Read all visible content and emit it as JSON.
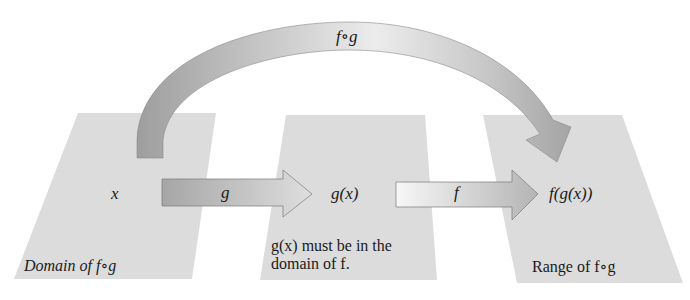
{
  "diagram": {
    "colors": {
      "panel": "#dcdcdc",
      "arrow_dark": "#a9a9a9",
      "arrow_light": "#f2f2f2",
      "text": "#1a1a1a"
    },
    "arc_arrow": {
      "label": "f∘g"
    },
    "g_arrow": {
      "label": "g"
    },
    "f_arrow": {
      "label": "f"
    },
    "panels": [
      {
        "point": "x",
        "caption": "Domain of f∘g"
      },
      {
        "point": "g(x)",
        "caption_line1": "g(x) must be in the",
        "caption_line2": "domain of f."
      },
      {
        "point": "f(g(x))",
        "caption": "Range of  f∘g"
      }
    ]
  }
}
